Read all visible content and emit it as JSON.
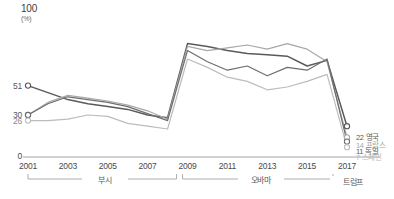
{
  "axis": {
    "y_max_label": "100",
    "y_unit": "(%)",
    "y_zero_label": "0",
    "y_ticks_left": [
      {
        "value": 51,
        "label": "51"
      },
      {
        "value": 30,
        "label": "30"
      },
      {
        "value": 26,
        "label": "26"
      }
    ],
    "x_labels": [
      "2001",
      "2003",
      "2005",
      "2007",
      "2009",
      "2011",
      "2013",
      "2015",
      "2017"
    ]
  },
  "eras": [
    {
      "name": "bush",
      "label": "부시"
    },
    {
      "name": "obama",
      "label": "오바마"
    },
    {
      "name": "trump",
      "label": "트럼프"
    }
  ],
  "end_labels": [
    {
      "value": "22",
      "name": "영국",
      "color": "#5a5a5a"
    },
    {
      "value": "14",
      "name": "프랑스",
      "color": "#a8a8a8"
    },
    {
      "value": "11",
      "name": "독일",
      "color": "#5a5a5a"
    },
    {
      "value": "7",
      "name": "스페인",
      "color": "#bcbcbc"
    }
  ],
  "chart_data": {
    "type": "line",
    "title": "",
    "xlabel": "",
    "ylabel": "(%)",
    "ylim": [
      0,
      100
    ],
    "grid": false,
    "legend": "right-end-labels",
    "x": [
      2001,
      2002,
      2003,
      2004,
      2005,
      2006,
      2007,
      2008,
      2009,
      2010,
      2011,
      2012,
      2013,
      2014,
      2015,
      2016,
      2017
    ],
    "series": [
      {
        "name": "영국",
        "name_en": "United Kingdom",
        "color": "#5a5a5a",
        "start_value": 51,
        "end_value": 22,
        "values": [
          51,
          46,
          41,
          38,
          36,
          34,
          30,
          28,
          81,
          79,
          76,
          74,
          73,
          72,
          65,
          69,
          22
        ]
      },
      {
        "name": "프랑스",
        "name_en": "France",
        "color": "#a8a8a8",
        "start_value": 30,
        "end_value": 14,
        "values": [
          30,
          39,
          44,
          42,
          40,
          37,
          33,
          27,
          79,
          76,
          78,
          80,
          77,
          81,
          77,
          68,
          14
        ]
      },
      {
        "name": "독일",
        "name_en": "Germany",
        "color": "#6e6e6e",
        "start_value": 30,
        "end_value": 11,
        "values": [
          30,
          38,
          43,
          41,
          39,
          36,
          31,
          26,
          76,
          68,
          62,
          65,
          58,
          64,
          62,
          70,
          11
        ]
      },
      {
        "name": "스페인",
        "name_en": "Spain",
        "color": "#bcbcbc",
        "start_value": 26,
        "end_value": 7,
        "values": [
          26,
          26,
          27,
          30,
          29,
          24,
          22,
          20,
          70,
          64,
          57,
          54,
          48,
          50,
          54,
          59,
          7
        ]
      }
    ]
  }
}
